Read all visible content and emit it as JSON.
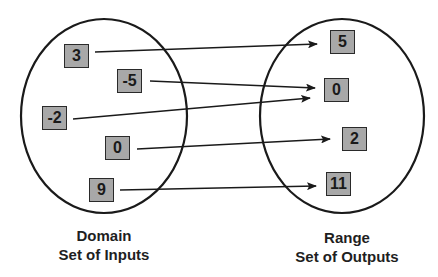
{
  "domain_set": {
    "title": "Domain",
    "subtitle": "Set of Inputs",
    "values": [
      {
        "label": "3",
        "x": 64,
        "y": 44
      },
      {
        "label": "-5",
        "x": 117,
        "y": 69
      },
      {
        "label": "-2",
        "x": 42,
        "y": 106
      },
      {
        "label": "0",
        "x": 105,
        "y": 136
      },
      {
        "label": "9",
        "x": 89,
        "y": 178
      }
    ]
  },
  "range_set": {
    "title": "Range",
    "subtitle": "Set of Outputs",
    "values": [
      {
        "label": "5",
        "x": 330,
        "y": 30
      },
      {
        "label": "0",
        "x": 324,
        "y": 78
      },
      {
        "label": "2",
        "x": 342,
        "y": 127
      },
      {
        "label": "11",
        "x": 326,
        "y": 172
      }
    ]
  },
  "mappings": [
    {
      "from": "3",
      "to": "5"
    },
    {
      "from": "-5",
      "to": "0"
    },
    {
      "from": "-2",
      "to": "0"
    },
    {
      "from": "0",
      "to": "2"
    },
    {
      "from": "9",
      "to": "11"
    }
  ],
  "colors": {
    "box_fill": "#a8a8a8",
    "stroke": "#1a1a1a",
    "background": "#ffffff"
  }
}
